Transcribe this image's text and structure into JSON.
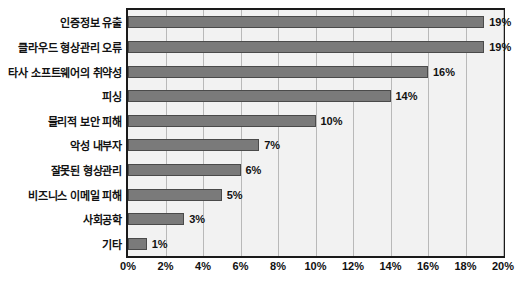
{
  "chart_data": {
    "type": "bar",
    "orientation": "horizontal",
    "title": "",
    "xlabel": "",
    "ylabel": "",
    "xlim": [
      0,
      20
    ],
    "grid": true,
    "legend": null,
    "value_suffix": "%",
    "categories": [
      "인증정보 유출",
      "클라우드 형상관리 오류",
      "타사 소프트웨어의 취약성",
      "피싱",
      "물리적 보안 피해",
      "악성 내부자",
      "잘못된 형상관리",
      "비즈니스 이메일 피해",
      "사회공학",
      "기타"
    ],
    "values": [
      19,
      19,
      16,
      14,
      10,
      7,
      6,
      5,
      3,
      1
    ],
    "data_labels": [
      "19%",
      "19%",
      "16%",
      "14%",
      "10%",
      "7%",
      "6%",
      "5%",
      "3%",
      "1%"
    ],
    "xticks": [
      0,
      2,
      4,
      6,
      8,
      10,
      12,
      14,
      16,
      18,
      20
    ],
    "xtick_labels": [
      "0%",
      "2%",
      "4%",
      "6%",
      "8%",
      "10%",
      "12%",
      "14%",
      "16%",
      "18%",
      "20%"
    ],
    "colors": {
      "bar_fill": "#7a7a7a",
      "bar_border": "#4a4a4a",
      "plot_background": "#f2f2f2",
      "plot_border": "#1a1a1a",
      "gridline": "#b9b9b9",
      "text": "#111111",
      "page_background": "#ffffff"
    }
  }
}
